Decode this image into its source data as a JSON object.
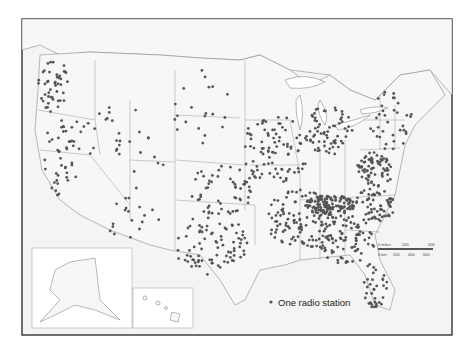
{
  "map": {
    "title": "",
    "legend": {
      "symbol": "dot",
      "label": "One radio station",
      "dot_color": "#555555"
    },
    "scale_bar": {
      "miles_label": "0 miles",
      "miles_ticks": [
        "200",
        "400"
      ],
      "km_label": "0 km",
      "km_ticks": [
        "200",
        "400",
        "600"
      ]
    },
    "insets": [
      {
        "name": "Alaska",
        "scale_label": "500 miles"
      },
      {
        "name": "Hawaii",
        "scale_label": "100 miles"
      }
    ],
    "colors": {
      "land": "#f7f7f7",
      "water": "#ffffff",
      "border": "#9a9a9a",
      "frame": "#333333"
    },
    "clusters": [
      {
        "region": "pacific-nw",
        "cx": 52,
        "cy": 85,
        "rx": 16,
        "ry": 30,
        "n": 45
      },
      {
        "region": "california",
        "cx": 60,
        "cy": 160,
        "rx": 18,
        "ry": 40,
        "n": 40
      },
      {
        "region": "idaho-nevada",
        "cx": 95,
        "cy": 135,
        "rx": 25,
        "ry": 40,
        "n": 18
      },
      {
        "region": "mountain",
        "cx": 140,
        "cy": 150,
        "rx": 25,
        "ry": 45,
        "n": 16
      },
      {
        "region": "southwest",
        "cx": 130,
        "cy": 215,
        "rx": 30,
        "ry": 25,
        "n": 18
      },
      {
        "region": "plains-north",
        "cx": 200,
        "cy": 110,
        "rx": 30,
        "ry": 40,
        "n": 20
      },
      {
        "region": "texas",
        "cx": 210,
        "cy": 245,
        "rx": 40,
        "ry": 30,
        "n": 80
      },
      {
        "region": "oklahoma-kansas",
        "cx": 220,
        "cy": 190,
        "rx": 35,
        "ry": 25,
        "n": 55
      },
      {
        "region": "midwest",
        "cx": 275,
        "cy": 150,
        "rx": 35,
        "ry": 35,
        "n": 90
      },
      {
        "region": "great-lakes",
        "cx": 330,
        "cy": 130,
        "rx": 25,
        "ry": 25,
        "n": 65
      },
      {
        "region": "south-central",
        "cx": 300,
        "cy": 220,
        "rx": 35,
        "ry": 30,
        "n": 110
      },
      {
        "region": "tennessee-dense",
        "cx": 330,
        "cy": 205,
        "rx": 25,
        "ry": 10,
        "n": 120
      },
      {
        "region": "southeast",
        "cx": 345,
        "cy": 240,
        "rx": 30,
        "ry": 25,
        "n": 90
      },
      {
        "region": "carolinas",
        "cx": 375,
        "cy": 205,
        "rx": 20,
        "ry": 18,
        "n": 60
      },
      {
        "region": "virginia",
        "cx": 375,
        "cy": 170,
        "rx": 18,
        "ry": 18,
        "n": 70
      },
      {
        "region": "northeast",
        "cx": 390,
        "cy": 120,
        "rx": 22,
        "ry": 30,
        "n": 35
      },
      {
        "region": "florida",
        "cx": 375,
        "cy": 285,
        "rx": 12,
        "ry": 25,
        "n": 35
      }
    ]
  }
}
